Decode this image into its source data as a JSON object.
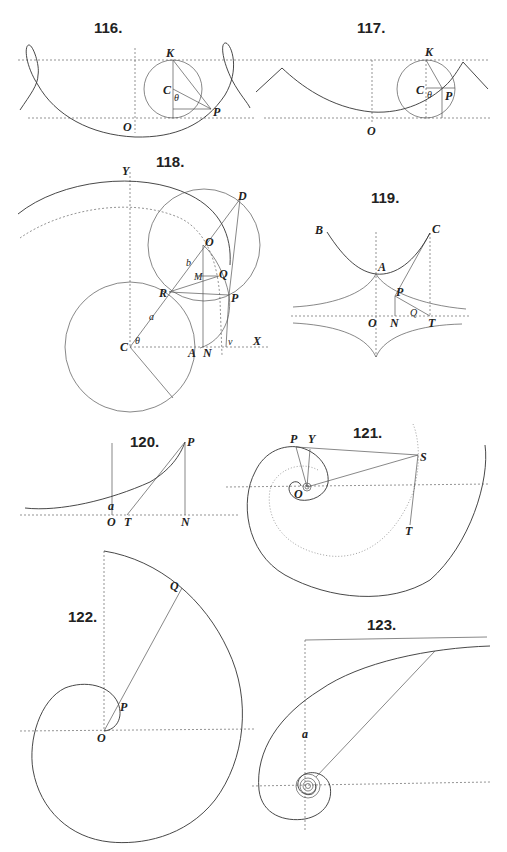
{
  "page": {
    "type": "Plate of geometric figures (curves)",
    "background": "#ffffff",
    "ink": "#222222"
  },
  "figures": [
    {
      "id": "fig116",
      "number": "116.",
      "subject": "trochoid (looped)",
      "labels": [
        "K",
        "C",
        "θ",
        "P",
        "O"
      ]
    },
    {
      "id": "fig117",
      "number": "117.",
      "subject": "trochoid (curtate)",
      "labels": [
        "K",
        "C",
        "θ",
        "P",
        "O"
      ]
    },
    {
      "id": "fig118",
      "number": "118.",
      "subject": "epicycloid construction",
      "labels": [
        "Y",
        "D",
        "O",
        "b",
        "M",
        "Q",
        "R",
        "P",
        "a",
        "C",
        "θ",
        "A",
        "N",
        "ν",
        "X"
      ]
    },
    {
      "id": "fig119",
      "number": "119.",
      "subject": "catenary and tractrix",
      "labels": [
        "B",
        "C",
        "A",
        "P",
        "Q",
        "O",
        "N",
        "T"
      ]
    },
    {
      "id": "fig120",
      "number": "120.",
      "subject": "catenary tangent",
      "labels": [
        "P",
        "a",
        "O",
        "T",
        "N"
      ]
    },
    {
      "id": "fig121",
      "number": "121.",
      "subject": "equiangular spiral",
      "labels": [
        "P",
        "Y",
        "S",
        "O",
        "T"
      ]
    },
    {
      "id": "fig122",
      "number": "122.",
      "subject": "spiral of Archimedes",
      "labels": [
        "Q",
        "P",
        "O"
      ]
    },
    {
      "id": "fig123",
      "number": "123.",
      "subject": "hyperbolic spiral",
      "labels": [
        "a"
      ]
    }
  ],
  "labels": {
    "f116": {
      "num": "116.",
      "K": "K",
      "C": "C",
      "theta": "θ",
      "P": "P",
      "O": "O"
    },
    "f117": {
      "num": "117.",
      "K": "K",
      "C": "C",
      "theta": "θ",
      "P": "P",
      "O": "O"
    },
    "f118": {
      "num": "118.",
      "Y": "Y",
      "D": "D",
      "O": "O",
      "b": "b",
      "M": "M",
      "Q": "Q",
      "R": "R",
      "P": "P",
      "a": "a",
      "C": "C",
      "theta": "θ",
      "A": "A",
      "N": "N",
      "nu": "ν",
      "X": "X"
    },
    "f119": {
      "num": "119.",
      "B": "B",
      "C": "C",
      "A": "A",
      "P": "P",
      "Q": "Q",
      "O": "O",
      "N": "N",
      "T": "T"
    },
    "f120": {
      "num": "120.",
      "P": "P",
      "a": "a",
      "O": "O",
      "T": "T",
      "N": "N"
    },
    "f121": {
      "num": "121.",
      "P": "P",
      "Y": "Y",
      "S": "S",
      "O": "O",
      "T": "T"
    },
    "f122": {
      "num": "122.",
      "Q": "Q",
      "P": "P",
      "O": "O"
    },
    "f123": {
      "num": "123.",
      "a": "a"
    }
  }
}
